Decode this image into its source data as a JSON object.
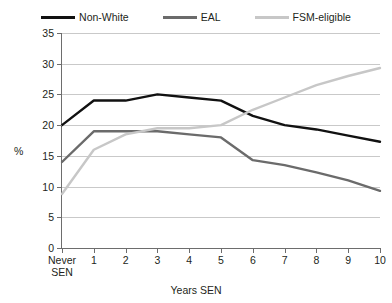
{
  "chart_data": {
    "type": "line",
    "title": "",
    "xlabel": "Years SEN",
    "ylabel": "%",
    "categories": [
      "Never\nSEN",
      "1",
      "2",
      "3",
      "4",
      "5",
      "6",
      "7",
      "8",
      "9",
      "10"
    ],
    "yticks": [
      0,
      5,
      10,
      15,
      20,
      25,
      30,
      35
    ],
    "ylim": [
      0,
      35
    ],
    "grid": "horizontal",
    "legend_position": "top-center",
    "series": [
      {
        "name": "Non-White",
        "color": "#111111",
        "values": [
          20.0,
          24.0,
          24.0,
          25.0,
          24.5,
          24.0,
          21.5,
          20.0,
          19.3,
          18.3,
          17.3
        ]
      },
      {
        "name": "EAL",
        "color": "#6b6b6b",
        "values": [
          14.0,
          19.0,
          19.0,
          19.0,
          18.5,
          18.0,
          14.3,
          13.5,
          12.3,
          11.0,
          9.3
        ]
      },
      {
        "name": "FSM-eligible",
        "color": "#c7c7c7",
        "values": [
          8.8,
          16.0,
          18.5,
          19.5,
          19.5,
          20.0,
          22.5,
          24.5,
          26.5,
          28.0,
          29.3
        ]
      }
    ]
  },
  "axes": {
    "y_axis_title": "%",
    "x_axis_title": "Years SEN"
  },
  "colors": {
    "non_white": "#111111",
    "eal": "#6b6b6b",
    "fsm": "#c7c7c7",
    "gridline": "#c9c9c9",
    "axis": "#6d6d6d",
    "text": "#231f20",
    "background": "#ffffff"
  }
}
